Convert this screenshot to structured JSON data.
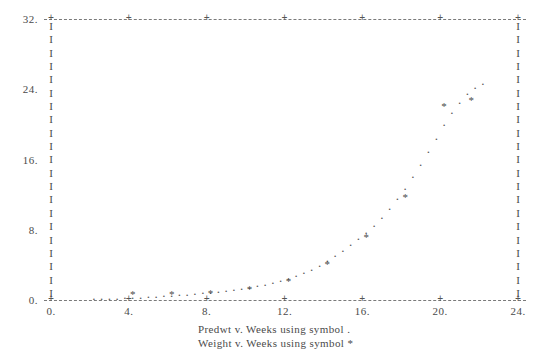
{
  "chart_data": {
    "type": "scatter",
    "title": "",
    "subtitle": "",
    "xlabel": "Weeks",
    "ylabel": "",
    "xlim": [
      0,
      24
    ],
    "ylim": [
      0,
      32
    ],
    "grid": false,
    "legend_position": "bottom",
    "x_ticks": [
      "0.",
      "4.",
      "8.",
      "12.",
      "16.",
      "20.",
      "24."
    ],
    "x_tick_values": [
      0,
      4,
      8,
      12,
      16,
      20,
      24
    ],
    "y_ticks": [
      "0.",
      "8.",
      "16.",
      "24.",
      "32."
    ],
    "y_tick_values": [
      0,
      8,
      16,
      24,
      32
    ],
    "series": [
      {
        "name": "Predwt",
        "symbol": ".",
        "symbol_name": "dot",
        "x": [
          2.2,
          2.6,
          3.0,
          3.4,
          3.8,
          4.2,
          4.6,
          5.0,
          5.4,
          5.8,
          6.2,
          6.6,
          7.0,
          7.4,
          7.8,
          8.2,
          8.6,
          9.0,
          9.4,
          9.8,
          10.2,
          10.6,
          11.0,
          11.4,
          11.8,
          12.2,
          12.6,
          13.0,
          13.4,
          13.8,
          14.2,
          14.6,
          15.0,
          15.4,
          15.8,
          16.2,
          16.6,
          17.0,
          17.4,
          17.8,
          18.2,
          18.6,
          19.0,
          19.4,
          19.8,
          20.2,
          20.6,
          21.0,
          21.4,
          21.8,
          22.2
        ],
        "y": [
          0.3,
          0.32,
          0.35,
          0.38,
          0.42,
          0.46,
          0.5,
          0.55,
          0.6,
          0.66,
          0.72,
          0.78,
          0.85,
          0.92,
          1.0,
          1.08,
          1.17,
          1.27,
          1.38,
          1.5,
          1.63,
          1.78,
          1.95,
          2.15,
          2.38,
          2.65,
          2.95,
          3.3,
          3.7,
          4.15,
          4.65,
          5.2,
          5.8,
          6.45,
          7.15,
          7.9,
          8.7,
          9.6,
          10.6,
          11.7,
          12.9,
          14.2,
          15.6,
          17.1,
          18.6,
          20.1,
          21.5,
          22.7,
          23.7,
          24.4,
          24.8
        ]
      },
      {
        "name": "Weight",
        "symbol": "*",
        "symbol_name": "asterisk",
        "x": [
          4.2,
          6.2,
          8.2,
          10.2,
          12.2,
          14.2,
          16.2,
          18.2,
          20.2,
          21.6
        ],
        "y": [
          1.1,
          1.1,
          1.3,
          1.7,
          2.6,
          4.6,
          7.6,
          12.2,
          22.6,
          23.2
        ]
      }
    ]
  },
  "legend": {
    "line1": "Predwt v. Weeks using symbol .",
    "line2": "Weight v. Weeks using symbol *"
  },
  "axis": {
    "tick_marker": "+",
    "vertical_marker": "I",
    "dash_color": "#7a7a7a",
    "text_color": "#4a4a4a"
  }
}
